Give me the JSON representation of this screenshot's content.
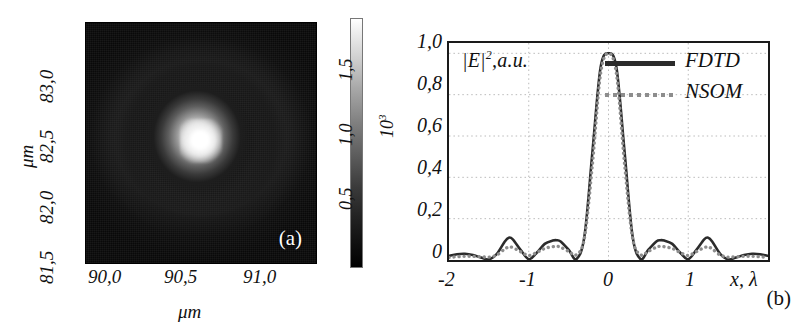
{
  "figure": {
    "panels": [
      {
        "tag": "(a)",
        "type": "image",
        "xlabel": "μm",
        "ylabel": "μm",
        "xticks": [
          "90,0",
          "90,5",
          "91,0"
        ],
        "yticks": [
          "81,5",
          "82,0",
          "82,5",
          "83,0"
        ],
        "colorbar": {
          "ticks": [
            "0,5",
            "1,0",
            "1,5"
          ],
          "unit": "10",
          "unit_exponent": "3",
          "top_color": "#ffffff",
          "bottom_color": "#000000"
        }
      },
      {
        "tag": "(b)",
        "type": "line",
        "ylabel": "|E|",
        "ylabel_exponent": "2",
        "ylabel_units": ",a.u.",
        "xlabel": "x, λ",
        "xticks": [
          "-2",
          "-1",
          "0",
          "1"
        ],
        "yticks": [
          "1,0",
          "0,8",
          "0,6",
          "0,4",
          "0,2",
          "0"
        ],
        "legend": [
          {
            "label": "FDTD",
            "style": "solid",
            "color": "#2b2b2b"
          },
          {
            "label": "NSOM",
            "style": "dotted",
            "color": "#8d8d8d"
          }
        ]
      }
    ]
  },
  "chart_data": {
    "type": "line",
    "title": "",
    "xlabel": "x, λ",
    "ylabel": "|E|^2, a.u.",
    "xlim": [
      -2,
      2
    ],
    "ylim": [
      0,
      1.05
    ],
    "xticks": [
      -2,
      -1,
      0,
      1
    ],
    "xticklabels": [
      "-2",
      "-1",
      "0",
      "1"
    ],
    "yticks": [
      0,
      0.2,
      0.4,
      0.6,
      0.8,
      1.0
    ],
    "yticklabels": [
      "0",
      "0,2",
      "0,4",
      "0,6",
      "0,8",
      "1,0"
    ],
    "grid": true,
    "grid_style": "dotted",
    "legend_position": "top-right",
    "x": [
      -2.0,
      -1.9,
      -1.8,
      -1.7,
      -1.6,
      -1.5,
      -1.4,
      -1.3,
      -1.25,
      -1.2,
      -1.1,
      -1.0,
      -0.9,
      -0.8,
      -0.7,
      -0.65,
      -0.6,
      -0.5,
      -0.4,
      -0.3,
      -0.2,
      -0.1,
      0.0,
      0.1,
      0.2,
      0.3,
      0.4,
      0.5,
      0.6,
      0.65,
      0.7,
      0.8,
      0.9,
      1.0,
      1.1,
      1.2,
      1.25,
      1.3,
      1.4,
      1.5,
      1.6,
      1.7,
      1.8,
      1.9,
      2.0
    ],
    "series": [
      {
        "name": "FDTD",
        "style": "solid",
        "color": "#2b2b2b",
        "values": [
          0.02,
          0.028,
          0.03,
          0.024,
          0.012,
          0.003,
          0.03,
          0.09,
          0.108,
          0.1,
          0.048,
          0.004,
          0.035,
          0.078,
          0.094,
          0.096,
          0.09,
          0.05,
          0.005,
          0.12,
          0.53,
          0.93,
          1.0,
          0.93,
          0.53,
          0.12,
          0.005,
          0.05,
          0.09,
          0.096,
          0.094,
          0.078,
          0.035,
          0.004,
          0.048,
          0.1,
          0.108,
          0.09,
          0.03,
          0.003,
          0.012,
          0.024,
          0.03,
          0.028,
          0.02
        ]
      },
      {
        "name": "NSOM",
        "style": "dotted",
        "color": "#8d8d8d",
        "values": [
          0.012,
          0.016,
          0.018,
          0.018,
          0.016,
          0.014,
          0.024,
          0.054,
          0.062,
          0.06,
          0.04,
          0.022,
          0.036,
          0.056,
          0.064,
          0.066,
          0.062,
          0.042,
          0.026,
          0.11,
          0.47,
          0.9,
          1.0,
          0.9,
          0.47,
          0.11,
          0.026,
          0.042,
          0.062,
          0.066,
          0.064,
          0.056,
          0.036,
          0.022,
          0.04,
          0.06,
          0.062,
          0.054,
          0.024,
          0.014,
          0.016,
          0.018,
          0.018,
          0.016,
          0.012
        ]
      }
    ]
  }
}
